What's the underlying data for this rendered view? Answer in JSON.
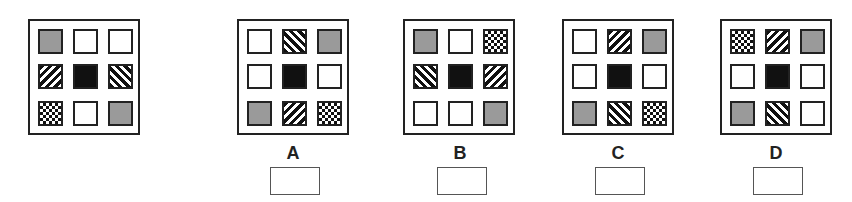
{
  "puzzle": {
    "reference": {
      "grid": [
        [
          "gray",
          "white",
          "white"
        ],
        [
          "hatch-fwd",
          "black",
          "hatch-back"
        ],
        [
          "checker",
          "white",
          "gray"
        ]
      ]
    },
    "options": [
      {
        "label": "A",
        "grid": [
          [
            "white",
            "hatch-back",
            "gray"
          ],
          [
            "white",
            "black",
            "white"
          ],
          [
            "gray",
            "hatch-fwd",
            "checker"
          ]
        ],
        "answer": ""
      },
      {
        "label": "B",
        "grid": [
          [
            "gray",
            "white",
            "checker"
          ],
          [
            "hatch-back",
            "black",
            "hatch-fwd"
          ],
          [
            "white",
            "white",
            "gray"
          ]
        ],
        "answer": ""
      },
      {
        "label": "C",
        "grid": [
          [
            "white",
            "hatch-fwd",
            "gray"
          ],
          [
            "white",
            "black",
            "white"
          ],
          [
            "gray",
            "hatch-back",
            "checker"
          ]
        ],
        "answer": ""
      },
      {
        "label": "D",
        "grid": [
          [
            "checker",
            "hatch-fwd",
            "gray"
          ],
          [
            "white",
            "black",
            "white"
          ],
          [
            "gray",
            "hatch-back",
            "white"
          ]
        ],
        "answer": ""
      }
    ]
  },
  "colors": {
    "gray": "#9a9a9a",
    "black": "#111111",
    "border": "#222222"
  }
}
